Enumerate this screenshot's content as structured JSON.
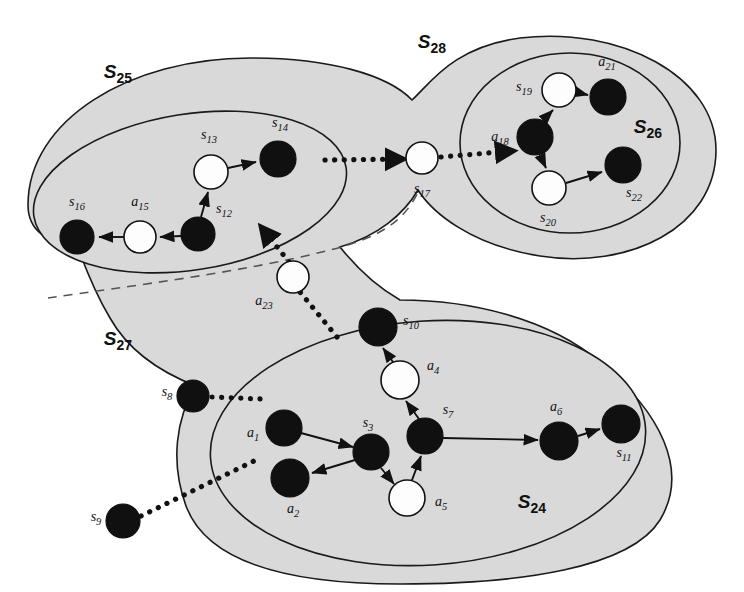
{
  "figure": {
    "type": "diagram",
    "kind": "hierarchical-state-abstraction-graph",
    "canvas": {
      "width": 744,
      "height": 592
    },
    "colors": {
      "region_fill": "#d9d9d9",
      "region_stroke": "#1a1a1a",
      "dark_node": "#101010",
      "light_node": "#fdfdfd",
      "edge": "#111111",
      "background": "#ffffff"
    }
  },
  "regions": [
    {
      "id": "S25",
      "letter": "S",
      "sub": "25",
      "label_x": 118,
      "label_y": 78,
      "kind": "inner-ellipse"
    },
    {
      "id": "S28",
      "letter": "S",
      "sub": "28",
      "label_x": 432,
      "label_y": 48,
      "kind": "outer-blob"
    },
    {
      "id": "S26",
      "letter": "S",
      "sub": "26",
      "label_x": 648,
      "label_y": 133,
      "kind": "inner-ellipse"
    },
    {
      "id": "S27",
      "letter": "S",
      "sub": "27",
      "label_x": 118,
      "label_y": 345,
      "kind": "outer-blob"
    },
    {
      "id": "S24",
      "letter": "S",
      "sub": "24",
      "label_x": 532,
      "label_y": 508,
      "kind": "inner-ellipse"
    }
  ],
  "nodes": [
    {
      "id": "s16",
      "letter": "s",
      "sub": "16",
      "x": 77,
      "y": 237,
      "r": 17,
      "fill": "dark",
      "label_x": 77,
      "label_y": 206,
      "region": "S25"
    },
    {
      "id": "a15",
      "letter": "a",
      "sub": "15",
      "x": 140,
      "y": 237,
      "r": 16,
      "fill": "light",
      "label_x": 140,
      "label_y": 206,
      "region": "S25"
    },
    {
      "id": "s12",
      "letter": "s",
      "sub": "12",
      "x": 198,
      "y": 234,
      "r": 17,
      "fill": "dark",
      "label_x": 224,
      "label_y": 213,
      "region": "S25"
    },
    {
      "id": "s13",
      "letter": "s",
      "sub": "13",
      "x": 211,
      "y": 172,
      "r": 17,
      "fill": "light",
      "label_x": 209,
      "label_y": 139,
      "region": "S25"
    },
    {
      "id": "s14",
      "letter": "s",
      "sub": "14",
      "x": 278,
      "y": 159,
      "r": 18,
      "fill": "dark",
      "label_x": 280,
      "label_y": 127,
      "region": "S25"
    },
    {
      "id": "s17",
      "letter": "s",
      "sub": "17",
      "x": 422,
      "y": 158,
      "r": 16,
      "fill": "light",
      "label_x": 422,
      "label_y": 193,
      "region": "S28"
    },
    {
      "id": "a18",
      "letter": "a",
      "sub": "18",
      "x": 535,
      "y": 137,
      "r": 18,
      "fill": "dark",
      "label_x": 500,
      "label_y": 141,
      "region": "S26"
    },
    {
      "id": "s19",
      "letter": "s",
      "sub": "19",
      "x": 559,
      "y": 90,
      "r": 17,
      "fill": "light",
      "label_x": 524,
      "label_y": 91,
      "region": "S26"
    },
    {
      "id": "a21",
      "letter": "a",
      "sub": "21",
      "x": 608,
      "y": 97,
      "r": 18,
      "fill": "dark",
      "label_x": 607,
      "label_y": 66,
      "region": "S26"
    },
    {
      "id": "s20",
      "letter": "s",
      "sub": "20",
      "x": 549,
      "y": 188,
      "r": 17,
      "fill": "light",
      "label_x": 548,
      "label_y": 222,
      "region": "S26"
    },
    {
      "id": "s22",
      "letter": "s",
      "sub": "22",
      "x": 623,
      "y": 165,
      "r": 18,
      "fill": "dark",
      "label_x": 634,
      "label_y": 197,
      "region": "S26"
    },
    {
      "id": "a23",
      "letter": "a",
      "sub": "23",
      "x": 293,
      "y": 277,
      "r": 16,
      "fill": "light",
      "label_x": 264,
      "label_y": 305,
      "region": "S27"
    },
    {
      "id": "s8",
      "letter": "s",
      "sub": "8",
      "x": 193,
      "y": 396,
      "r": 16,
      "fill": "dark",
      "label_x": 167,
      "label_y": 396,
      "region": "S27"
    },
    {
      "id": "s9",
      "letter": "s",
      "sub": "9",
      "x": 123,
      "y": 521,
      "r": 17,
      "fill": "dark",
      "label_x": 96,
      "label_y": 521,
      "region": "S27"
    },
    {
      "id": "a1",
      "letter": "a",
      "sub": "1",
      "x": 284,
      "y": 428,
      "r": 18,
      "fill": "dark",
      "label_x": 253,
      "label_y": 437,
      "region": "S24"
    },
    {
      "id": "a2",
      "letter": "a",
      "sub": "2",
      "x": 290,
      "y": 478,
      "r": 19,
      "fill": "dark",
      "label_x": 293,
      "label_y": 513,
      "region": "S24"
    },
    {
      "id": "s3",
      "letter": "s",
      "sub": "3",
      "x": 371,
      "y": 452,
      "r": 18,
      "fill": "dark",
      "label_x": 368,
      "label_y": 427,
      "region": "S24"
    },
    {
      "id": "a5",
      "letter": "a",
      "sub": "5",
      "x": 407,
      "y": 498,
      "r": 18,
      "fill": "light",
      "label_x": 441,
      "label_y": 506,
      "region": "S24"
    },
    {
      "id": "s7",
      "letter": "s",
      "sub": "7",
      "x": 425,
      "y": 436,
      "r": 18,
      "fill": "dark",
      "label_x": 448,
      "label_y": 414,
      "region": "S24"
    },
    {
      "id": "a4",
      "letter": "a",
      "sub": "4",
      "x": 400,
      "y": 380,
      "r": 19,
      "fill": "light",
      "label_x": 433,
      "label_y": 370,
      "region": "S24"
    },
    {
      "id": "s10",
      "letter": "s",
      "sub": "10",
      "x": 378,
      "y": 327,
      "r": 19,
      "fill": "dark",
      "label_x": 411,
      "label_y": 325,
      "region": "S24"
    },
    {
      "id": "a6",
      "letter": "a",
      "sub": "6",
      "x": 559,
      "y": 441,
      "r": 19,
      "fill": "dark",
      "label_x": 556,
      "label_y": 411,
      "region": "S24"
    },
    {
      "id": "s11",
      "letter": "s",
      "sub": "11",
      "x": 621,
      "y": 424,
      "r": 19,
      "fill": "dark",
      "label_x": 624,
      "label_y": 457,
      "region": "S24"
    }
  ],
  "edges_solid": [
    {
      "from": "s12",
      "to": "a15"
    },
    {
      "from": "a15",
      "to": "s16"
    },
    {
      "from": "s12",
      "to": "s13"
    },
    {
      "from": "s13",
      "to": "s14"
    },
    {
      "from": "a18",
      "to": "s19"
    },
    {
      "from": "s19",
      "to": "a21"
    },
    {
      "from": "a18",
      "to": "s20"
    },
    {
      "from": "s20",
      "to": "s22"
    },
    {
      "from": "a1",
      "to": "s3"
    },
    {
      "from": "s3",
      "to": "a2"
    },
    {
      "from": "s3",
      "to": "a5"
    },
    {
      "from": "a5",
      "to": "s7"
    },
    {
      "from": "s7",
      "to": "a4"
    },
    {
      "from": "a4",
      "to": "s10"
    },
    {
      "from": "s7",
      "to": "a6"
    },
    {
      "from": "a6",
      "to": "s11"
    }
  ],
  "edges_dotted": [
    {
      "from": "s14",
      "to": "s17",
      "note": "s14 exits S25 toward s17"
    },
    {
      "from": "s17",
      "to": "a18",
      "note": "s17 enters S26 at a18"
    },
    {
      "from": "a23",
      "to": "S25",
      "note": "a23 arrow up-left into S25"
    },
    {
      "from": "s10",
      "to": "a23",
      "note": "from S24 down-right of a23"
    },
    {
      "from": "s8",
      "to": "S24",
      "note": "s8 enters S24"
    },
    {
      "from": "s9",
      "to": "S24",
      "note": "s9 enters S24"
    }
  ]
}
